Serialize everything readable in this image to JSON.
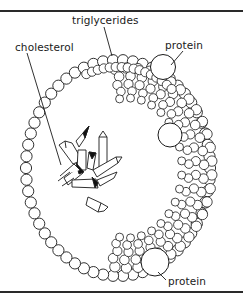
{
  "diagram": {
    "labels": {
      "triglycerides": "triglycerides",
      "cholesterol": "cholesterol",
      "protein_top": "protein",
      "protein_bottom": "protein"
    },
    "colors": {
      "ink": "#1a1a1a",
      "background": "#ffffff",
      "rule": "#2a2a2a"
    }
  }
}
